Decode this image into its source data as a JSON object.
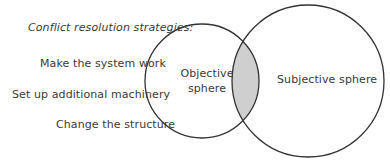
{
  "diagram": {
    "heading": "Conflict resolution strategies:",
    "strategies": [
      "Make the system work",
      "Set up additional machinery",
      "Change the structure"
    ],
    "circles": [
      {
        "name": "objective",
        "label_line1": "Objective",
        "label_line2": "sphere",
        "cx": 202,
        "cy": 81,
        "r": 57
      },
      {
        "name": "subjective",
        "label": "Subjective sphere",
        "cx": 308,
        "cy": 81,
        "r": 76
      }
    ],
    "colors": {
      "stroke": "#333333",
      "overlap_fill": "#cfcfcf",
      "text": "#3a3a3a"
    }
  }
}
